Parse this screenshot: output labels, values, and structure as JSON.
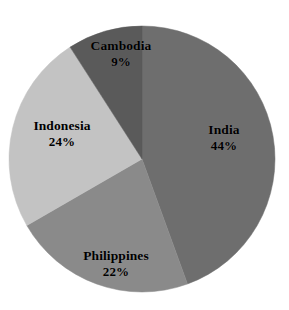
{
  "chart_data": {
    "type": "pie",
    "title": "",
    "subtitle": "",
    "xlabel": "",
    "ylabel": "",
    "grid": false,
    "legend": "none",
    "labels_inside_slices": true,
    "start_angle_deg": 0,
    "direction": "clockwise",
    "categories": [
      "India",
      "Philippines",
      "Indonesia",
      "Cambodia"
    ],
    "values": [
      44,
      22,
      24,
      9
    ],
    "value_unit": "%",
    "slices": [
      {
        "label": "India",
        "value": 44,
        "value_text": "44%",
        "color": "#6e6e6e"
      },
      {
        "label": "Philippines",
        "value": 22,
        "value_text": "22%",
        "color": "#8a8a8a"
      },
      {
        "label": "Indonesia",
        "value": 24,
        "value_text": "24%",
        "color": "#c3c3c3"
      },
      {
        "label": "Cambodia",
        "value": 9,
        "value_text": "9%",
        "color": "#5a5a5a"
      }
    ]
  },
  "geometry": {
    "center_x": 142,
    "center_y": 159,
    "radius": 133
  },
  "colors": {
    "background": "#ffffff",
    "label_text": "#000000",
    "india": "#6e6e6e",
    "philippines": "#8a8a8a",
    "indonesia": "#c3c3c3",
    "cambodia": "#5a5a5a"
  }
}
